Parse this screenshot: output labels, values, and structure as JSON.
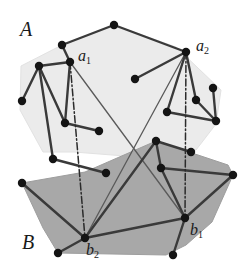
{
  "figure": {
    "width": 251,
    "height": 275,
    "background": "#ffffff"
  },
  "colors": {
    "polygon_a_fill": "#ebebeb",
    "polygon_a_stroke": "#e2e2e2",
    "polygon_b_fill": "#a8a8a8",
    "polygon_b_stroke": "#9e9e9e",
    "edge_stroke": "#3a3a3a",
    "thin_edge_stroke": "#5a5a5a",
    "dash_stroke": "#2b2b2b",
    "node_fill": "#141414",
    "label_color": "#1a1a1a"
  },
  "labels": {
    "set_a": "A",
    "set_b": "B",
    "a1": "a",
    "a1_sub": "1",
    "a2": "a",
    "a2_sub": "2",
    "b1": "b",
    "b1_sub": "1",
    "b2": "b",
    "b2_sub": "2"
  },
  "label_positions": {
    "set_a": {
      "x": 20,
      "y": 19
    },
    "set_b": {
      "x": 22,
      "y": 232
    },
    "a1": {
      "x": 78,
      "y": 48
    },
    "a2": {
      "x": 196,
      "y": 38
    },
    "b1": {
      "x": 190,
      "y": 222
    },
    "b2": {
      "x": 86,
      "y": 242
    }
  },
  "polygon_a": {
    "name": "hull-a",
    "points": "62,45 114,25 176,47 221,90 216,124 196,150 150,158 74,152 43,152 20,110 21,66"
  },
  "polygon_b": {
    "name": "hull-b",
    "points": "22,183 85,172 156,141 228,165 233,175 212,222 186,245 166,255 58,253 43,228"
  },
  "chart_data": {
    "type": "scatter",
    "grid": false,
    "legend": false,
    "xlim": [
      0,
      251
    ],
    "ylim": [
      0,
      275
    ],
    "series": [
      {
        "name": "A",
        "label": "A",
        "fill": "#ebebeb",
        "points": [
          {
            "id": "a_top",
            "x": 114,
            "y": 25
          },
          {
            "id": "a_nw",
            "x": 62,
            "y": 45
          },
          {
            "id": "a1",
            "x": 70,
            "y": 62,
            "label": "a1"
          },
          {
            "id": "a_w",
            "x": 39,
            "y": 66
          },
          {
            "id": "a_wlow",
            "x": 22,
            "y": 101
          },
          {
            "id": "a_mid_l",
            "x": 65,
            "y": 123
          },
          {
            "id": "a_mid_r",
            "x": 99,
            "y": 131
          },
          {
            "id": "a_bl",
            "x": 53,
            "y": 159
          },
          {
            "id": "a_bl2",
            "x": 106,
            "y": 173
          },
          {
            "id": "a_center",
            "x": 135,
            "y": 79
          },
          {
            "id": "a2",
            "x": 186,
            "y": 52,
            "label": "a2"
          },
          {
            "id": "a_e_hi",
            "x": 213,
            "y": 88
          },
          {
            "id": "a_e_mid",
            "x": 196,
            "y": 100
          },
          {
            "id": "a_e_in",
            "x": 167,
            "y": 112
          },
          {
            "id": "a_e_lo",
            "x": 216,
            "y": 121
          }
        ]
      },
      {
        "name": "B",
        "label": "B",
        "fill": "#a8a8a8",
        "points": [
          {
            "id": "b_nw",
            "x": 22,
            "y": 183
          },
          {
            "id": "b_n1",
            "x": 156,
            "y": 141
          },
          {
            "id": "b_n2",
            "x": 191,
            "y": 152
          },
          {
            "id": "b_n3",
            "x": 161,
            "y": 168
          },
          {
            "id": "b_e",
            "x": 233,
            "y": 175
          },
          {
            "id": "b1",
            "x": 185,
            "y": 218,
            "label": "b1"
          },
          {
            "id": "b_se",
            "x": 173,
            "y": 255
          },
          {
            "id": "b2",
            "x": 85,
            "y": 238,
            "label": "b2"
          },
          {
            "id": "b_sw",
            "x": 58,
            "y": 253
          }
        ]
      }
    ],
    "edges_a": [
      [
        "a_nw",
        "a_top"
      ],
      [
        "a_top",
        "a2"
      ],
      [
        "a_nw",
        "a1"
      ],
      [
        "a1",
        "a_w"
      ],
      [
        "a_w",
        "a_wlow"
      ],
      [
        "a_w",
        "a_mid_l"
      ],
      [
        "a_w",
        "a_bl"
      ],
      [
        "a_mid_l",
        "a_mid_r"
      ],
      [
        "a_bl",
        "a_bl2"
      ],
      [
        "a1",
        "a_mid_l"
      ],
      [
        "a2",
        "a_center"
      ],
      [
        "a2",
        "a_e_in"
      ],
      [
        "a2",
        "a_e_mid"
      ],
      [
        "a_e_mid",
        "a_e_lo"
      ],
      [
        "a_e_hi",
        "a_e_lo"
      ],
      [
        "a_e_in",
        "a_e_lo"
      ]
    ],
    "edges_b": [
      [
        "b_nw",
        "b2"
      ],
      [
        "b2",
        "b_sw"
      ],
      [
        "b2",
        "b1"
      ],
      [
        "b1",
        "b_se"
      ],
      [
        "b1",
        "b_e"
      ],
      [
        "b_e",
        "b_n3"
      ],
      [
        "b_n3",
        "b_n1"
      ],
      [
        "b_n1",
        "b_n2"
      ],
      [
        "b_n3",
        "b1"
      ],
      [
        "b_n1",
        "b2"
      ]
    ],
    "cross_edges": [
      [
        "a1",
        "b1"
      ],
      [
        "a2",
        "b2"
      ]
    ],
    "dashed_edges": [
      [
        "a1",
        "b2"
      ],
      [
        "a2",
        "b1"
      ]
    ],
    "crossing_point": {
      "x": 136,
      "y": 143
    },
    "annotations": [
      {
        "text": "A",
        "x": 20,
        "y": 19,
        "kind": "set-label"
      },
      {
        "text": "B",
        "x": 22,
        "y": 232,
        "kind": "set-label"
      },
      {
        "text": "a1",
        "x": 78,
        "y": 48,
        "kind": "vertex-label"
      },
      {
        "text": "a2",
        "x": 196,
        "y": 38,
        "kind": "vertex-label"
      },
      {
        "text": "b1",
        "x": 190,
        "y": 222,
        "kind": "vertex-label"
      },
      {
        "text": "b2",
        "x": 86,
        "y": 242,
        "kind": "vertex-label"
      }
    ]
  }
}
